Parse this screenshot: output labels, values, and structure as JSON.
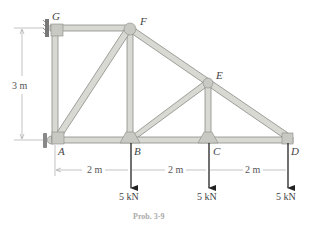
{
  "figure": {
    "caption": "Prob. 3-9",
    "joints": {
      "A": "A",
      "B": "B",
      "C": "C",
      "D": "D",
      "E": "E",
      "F": "F",
      "G": "G"
    },
    "dimensions": {
      "height": "3 m",
      "span_AB": "2 m",
      "span_BC": "2 m",
      "span_CD": "2 m"
    },
    "loads": {
      "B": "5 kN",
      "C": "5 kN",
      "D": "5 kN"
    },
    "colors": {
      "member_fill": "#d9d9d4",
      "member_edge": "#8a8a85",
      "gusset": "#c9c9c3",
      "dimension_line": "#9a9a9a",
      "load_arrow": "#222222"
    }
  }
}
